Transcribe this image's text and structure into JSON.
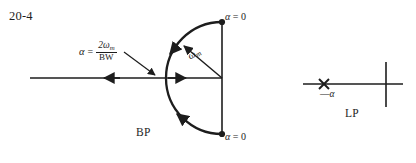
{
  "figure": {
    "number": "20-4",
    "bp_caption": "BP",
    "lp_caption": "LP"
  },
  "formula": {
    "alpha_symbol": "α",
    "equals": "=",
    "numerator": "2ω",
    "numerator_sub": "m",
    "denominator": "BW",
    "full_text": "α = 2ωm / BW"
  },
  "labels": {
    "omega_m": "ω",
    "omega_m_sub": "m",
    "alpha_zero_top": "α",
    "alpha_zero_top_rest": " = 0",
    "alpha_zero_bottom": "α",
    "alpha_zero_bottom_rest": " = 0",
    "minus_alpha_dash": "—",
    "minus_alpha_symbol": "α"
  },
  "colors": {
    "ink": "#1d1d1d",
    "background": "#ffffff"
  },
  "geometry": {
    "bp_vertical_axis_x": 222,
    "bp_center_y": 78,
    "bp_arc_vertex_x": 158,
    "bp_pole_top_y": 22,
    "bp_pole_bottom_y": 134,
    "lp_real_axis_y": 84,
    "lp_pole_x": 324,
    "lp_axes_cross_x": 386
  }
}
